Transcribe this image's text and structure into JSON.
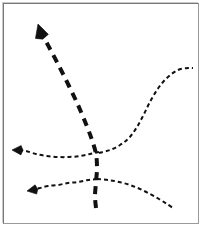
{
  "figure": {
    "background_color": "#ffffff",
    "border_color": "#8c8c8c",
    "stroke_color": "#111111",
    "width": 205,
    "height": 230
  },
  "chart_data": {
    "type": "line",
    "xlabel": "",
    "ylabel": "",
    "grid": false,
    "legend": "none",
    "xlim": [
      0,
      205
    ],
    "ylim": [
      0,
      230
    ],
    "note": "Coordinates are in image pixel space, y increases downward.",
    "series": [
      {
        "name": "thick-rising-arrow",
        "style": "dashed",
        "stroke_width": 4,
        "dash": "8 6",
        "arrow_at": "start",
        "arrow_points": "up-left",
        "color": "#111111",
        "points": [
          [
            96,
            208
          ],
          [
            95,
            196
          ],
          [
            96,
            182
          ],
          [
            97,
            168
          ],
          [
            96,
            154
          ],
          [
            92,
            140
          ],
          [
            86,
            124
          ],
          [
            78,
            105
          ],
          [
            69,
            86
          ],
          [
            59,
            66
          ],
          [
            49,
            47
          ],
          [
            42,
            34
          ]
        ],
        "arrow_tip": [
          38,
          24
        ]
      },
      {
        "name": "right-s-curve",
        "style": "dashed",
        "stroke_width": 2,
        "dash": "4 3",
        "arrow_at": "none",
        "color": "#111111",
        "points": [
          [
            99,
            153
          ],
          [
            110,
            150
          ],
          [
            120,
            145
          ],
          [
            129,
            138
          ],
          [
            137,
            127
          ],
          [
            144,
            114
          ],
          [
            151,
            100
          ],
          [
            159,
            87
          ],
          [
            168,
            77
          ],
          [
            178,
            70
          ],
          [
            188,
            68
          ],
          [
            193,
            68
          ]
        ]
      },
      {
        "name": "middle-left-arrow-curve",
        "style": "dashed",
        "stroke_width": 2,
        "dash": "4 3",
        "arrow_at": "start",
        "arrow_points": "left",
        "color": "#111111",
        "points": [
          [
            99,
            152
          ],
          [
            90,
            154
          ],
          [
            80,
            156
          ],
          [
            69,
            157
          ],
          [
            58,
            157
          ],
          [
            47,
            156
          ],
          [
            36,
            154
          ],
          [
            26,
            151
          ],
          [
            19,
            150
          ]
        ],
        "arrow_tip": [
          12,
          150
        ]
      },
      {
        "name": "lower-left-arrow-curve",
        "style": "dashed",
        "stroke_width": 2,
        "dash": "4 3",
        "arrow_at": "start",
        "arrow_points": "left-down",
        "color": "#111111",
        "points": [
          [
            97,
            179
          ],
          [
            88,
            180
          ],
          [
            78,
            182
          ],
          [
            68,
            183
          ],
          [
            58,
            185
          ],
          [
            48,
            186
          ],
          [
            40,
            188
          ],
          [
            34,
            189
          ]
        ],
        "arrow_tip": [
          27,
          191
        ]
      },
      {
        "name": "lower-right-descending-curve",
        "style": "dashed",
        "stroke_width": 2,
        "dash": "4 3",
        "arrow_at": "none",
        "color": "#111111",
        "points": [
          [
            97,
            179
          ],
          [
            108,
            180
          ],
          [
            119,
            182
          ],
          [
            130,
            185
          ],
          [
            140,
            189
          ],
          [
            150,
            194
          ],
          [
            159,
            199
          ],
          [
            167,
            204
          ],
          [
            173,
            208
          ]
        ]
      }
    ]
  }
}
